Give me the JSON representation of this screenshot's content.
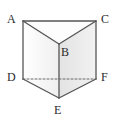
{
  "figure": {
    "name": "triangular-prism",
    "canvas": {
      "width": 117,
      "height": 121,
      "background": "#ffffff"
    },
    "colors": {
      "stroke": "#555555",
      "stroke_light": "#7a7a7a",
      "face_left": "#fafafa",
      "face_right": "#ececec",
      "face_top": "#fdfdfd",
      "face_bottom": "#e4e4e4",
      "label": "#2b2b2b",
      "dash": "#666666"
    },
    "vertices": [
      {
        "id": "A",
        "label": "A",
        "x": 23,
        "y": 21,
        "label_x": 7,
        "label_y": 13,
        "hidden": false
      },
      {
        "id": "C",
        "label": "C",
        "x": 96,
        "y": 21,
        "label_x": 101,
        "label_y": 13,
        "hidden": false
      },
      {
        "id": "B",
        "label": "B",
        "x": 59,
        "y": 44,
        "label_x": 61,
        "label_y": 46,
        "hidden": false
      },
      {
        "id": "D",
        "label": "D",
        "x": 23,
        "y": 79,
        "label_x": 7,
        "label_y": 71,
        "hidden": false
      },
      {
        "id": "F",
        "label": "F",
        "x": 96,
        "y": 79,
        "label_x": 101,
        "label_y": 71,
        "hidden": false
      },
      {
        "id": "E",
        "label": "E",
        "x": 59,
        "y": 98,
        "label_x": 54,
        "label_y": 104,
        "hidden": false
      }
    ],
    "faces": [
      {
        "id": "top",
        "name": "top-face-ABC",
        "points": "23,21 59,44 96,21",
        "fill": "#fdfdfd"
      },
      {
        "id": "left",
        "name": "left-face-ABED",
        "points": "23,21 59,44 59,98 23,79",
        "fill": "#fafafa"
      },
      {
        "id": "right",
        "name": "right-face-BCFE",
        "points": "59,44 96,21 96,79 59,98",
        "fill": "#ececec"
      },
      {
        "id": "bottom",
        "name": "bottom-face-DEF",
        "points": "23,79 59,98 96,79",
        "fill": "#e6e6e6"
      }
    ],
    "edges": [
      {
        "id": "AC",
        "name": "edge-a-c",
        "x1": 23,
        "y1": 21,
        "x2": 96,
        "y2": 21,
        "style": "solid"
      },
      {
        "id": "AB",
        "name": "edge-a-b",
        "x1": 23,
        "y1": 21,
        "x2": 59,
        "y2": 44,
        "style": "solid"
      },
      {
        "id": "CB",
        "name": "edge-c-b",
        "x1": 96,
        "y1": 21,
        "x2": 59,
        "y2": 44,
        "style": "solid"
      },
      {
        "id": "AD",
        "name": "edge-a-d",
        "x1": 23,
        "y1": 21,
        "x2": 23,
        "y2": 79,
        "style": "solid"
      },
      {
        "id": "CF",
        "name": "edge-c-f",
        "x1": 96,
        "y1": 21,
        "x2": 96,
        "y2": 79,
        "style": "solid"
      },
      {
        "id": "BE",
        "name": "edge-b-e",
        "x1": 59,
        "y1": 44,
        "x2": 59,
        "y2": 98,
        "style": "solid"
      },
      {
        "id": "DE",
        "name": "edge-d-e",
        "x1": 23,
        "y1": 79,
        "x2": 59,
        "y2": 98,
        "style": "solid"
      },
      {
        "id": "FE",
        "name": "edge-f-e",
        "x1": 96,
        "y1": 79,
        "x2": 59,
        "y2": 98,
        "style": "solid"
      },
      {
        "id": "DF",
        "name": "edge-d-f-hidden",
        "x1": 23,
        "y1": 79,
        "x2": 96,
        "y2": 79,
        "style": "dashed"
      }
    ],
    "labels": {
      "A": "A",
      "B": "B",
      "C": "C",
      "D": "D",
      "E": "E",
      "F": "F"
    }
  }
}
